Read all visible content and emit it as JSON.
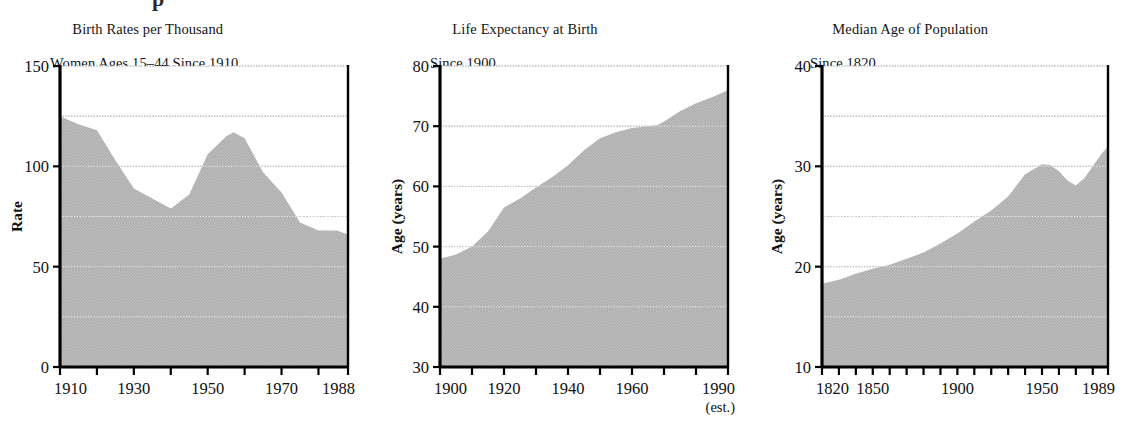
{
  "page": {
    "clipped_headline_fragment": "p",
    "fill_color": "#b9b9b9",
    "axis_color": "#000000",
    "grid_color": "#5a5a5a",
    "background": "#ffffff"
  },
  "chart_data": [
    {
      "type": "area",
      "index": 0,
      "title": "Birth Rates per Thousand",
      "subtitle": "Women Ages 15–44 Since 1910",
      "xlabel": "",
      "ylabel": "Rate",
      "xlim": [
        1910,
        1988
      ],
      "ylim": [
        0,
        150
      ],
      "yticks": [
        0,
        50,
        100,
        150
      ],
      "ytick_labels": [
        "0",
        "50",
        "100",
        "150"
      ],
      "gridlines": [
        25,
        50,
        75,
        100,
        125,
        150
      ],
      "grid": true,
      "xticks": [
        1910,
        1920,
        1930,
        1940,
        1950,
        1960,
        1970,
        1980,
        1988
      ],
      "xtick_labels": [
        "1910",
        "",
        "1930",
        "",
        "1950",
        "",
        "1970",
        "",
        "1988"
      ],
      "x": [
        1910,
        1915,
        1920,
        1925,
        1930,
        1935,
        1940,
        1945,
        1950,
        1955,
        1957,
        1960,
        1965,
        1970,
        1975,
        1980,
        1985,
        1988
      ],
      "values": [
        125,
        121,
        118,
        103,
        89,
        84,
        79,
        86,
        106,
        115,
        117,
        114,
        97,
        87,
        72,
        68,
        68,
        66
      ],
      "legend": null
    },
    {
      "type": "area",
      "index": 1,
      "title": "Life Expectancy at Birth",
      "subtitle": "Since 1900",
      "xlabel": "",
      "ylabel": "Age (years)",
      "xlim": [
        1900,
        1990
      ],
      "ylim": [
        30,
        80
      ],
      "yticks": [
        30,
        40,
        50,
        60,
        70,
        80
      ],
      "ytick_labels": [
        "30",
        "40",
        "50",
        "60",
        "70",
        "80"
      ],
      "gridlines": [
        40,
        50,
        60,
        70,
        80
      ],
      "grid": true,
      "xticks": [
        1900,
        1910,
        1920,
        1930,
        1940,
        1950,
        1960,
        1970,
        1980,
        1990
      ],
      "xtick_labels": [
        "1900",
        "",
        "1920",
        "",
        "1940",
        "",
        "1960",
        "",
        "",
        "1990"
      ],
      "x_note": "(est.)",
      "x": [
        1900,
        1905,
        1910,
        1915,
        1920,
        1925,
        1930,
        1935,
        1940,
        1945,
        1950,
        1955,
        1960,
        1965,
        1968,
        1970,
        1975,
        1980,
        1985,
        1988,
        1990
      ],
      "values": [
        48.0,
        48.7,
        50.0,
        52.5,
        56.5,
        58.0,
        59.8,
        61.5,
        63.5,
        66.0,
        68.0,
        69.0,
        69.7,
        70.0,
        70.2,
        70.8,
        72.5,
        73.8,
        74.8,
        75.5,
        76.0
      ],
      "legend": null
    },
    {
      "type": "area",
      "index": 2,
      "title": "Median Age of Population",
      "subtitle": "Since 1820",
      "xlabel": "",
      "ylabel": "Age (years)",
      "xlim": [
        1820,
        1989
      ],
      "ylim": [
        10,
        40
      ],
      "yticks": [
        10,
        20,
        30,
        40
      ],
      "ytick_labels": [
        "10",
        "20",
        "30",
        "40"
      ],
      "gridlines": [
        15,
        20,
        25,
        30,
        35,
        40
      ],
      "grid": true,
      "xticks": [
        1820,
        1830,
        1840,
        1850,
        1860,
        1870,
        1880,
        1890,
        1900,
        1910,
        1920,
        1930,
        1940,
        1950,
        1960,
        1970,
        1980,
        1989
      ],
      "xtick_labels": [
        "1820",
        "",
        "",
        "1850",
        "",
        "",
        "",
        "",
        "1900",
        "",
        "",
        "",
        "",
        "1950",
        "",
        "",
        "",
        "1989"
      ],
      "x": [
        1820,
        1830,
        1840,
        1850,
        1860,
        1870,
        1880,
        1890,
        1900,
        1910,
        1920,
        1930,
        1940,
        1950,
        1955,
        1960,
        1965,
        1970,
        1975,
        1980,
        1985,
        1989
      ],
      "values": [
        18.3,
        18.7,
        19.3,
        19.8,
        20.2,
        20.8,
        21.4,
        22.3,
        23.3,
        24.5,
        25.6,
        27.0,
        29.2,
        30.2,
        30.1,
        29.5,
        28.6,
        28.1,
        28.8,
        30.0,
        31.2,
        32.0
      ],
      "legend": null
    }
  ]
}
